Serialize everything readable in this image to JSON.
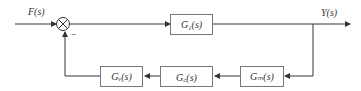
{
  "diagram": {
    "type": "block-diagram",
    "input": {
      "label": "F(s)"
    },
    "output": {
      "label": "Y(s)"
    },
    "summing_junction": {
      "feedback_sign": "−"
    },
    "blocks": [
      {
        "id": "g1",
        "label": "G₁(s)",
        "path": "forward"
      },
      {
        "id": "gm",
        "label": "Gₘ(s)",
        "path": "feedback"
      },
      {
        "id": "gc",
        "label": "G꜀(s)",
        "path": "feedback"
      },
      {
        "id": "gv",
        "label": "Gᵥ(s)",
        "path": "feedback"
      }
    ],
    "colors": {
      "line": "#333333",
      "box_border": "#777777"
    }
  }
}
